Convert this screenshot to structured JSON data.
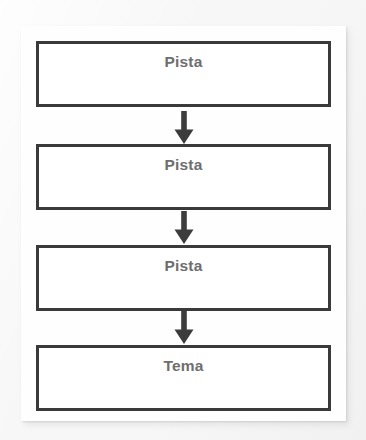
{
  "diagram": {
    "title": "",
    "background_color": "#f6f6f6",
    "card_color": "#fefefe",
    "border_color": "#3a3a3a",
    "text_color": "#6e6e6e",
    "orientation": "vertical",
    "nodes": [
      {
        "label": "Pista"
      },
      {
        "label": "Pista"
      },
      {
        "label": "Pista"
      },
      {
        "label": "Tema"
      }
    ],
    "connectors": [
      {
        "icon": "arrow-down-icon",
        "from": 0,
        "to": 1
      },
      {
        "icon": "arrow-down-icon",
        "from": 1,
        "to": 2
      },
      {
        "icon": "arrow-down-icon",
        "from": 2,
        "to": 3
      }
    ]
  }
}
